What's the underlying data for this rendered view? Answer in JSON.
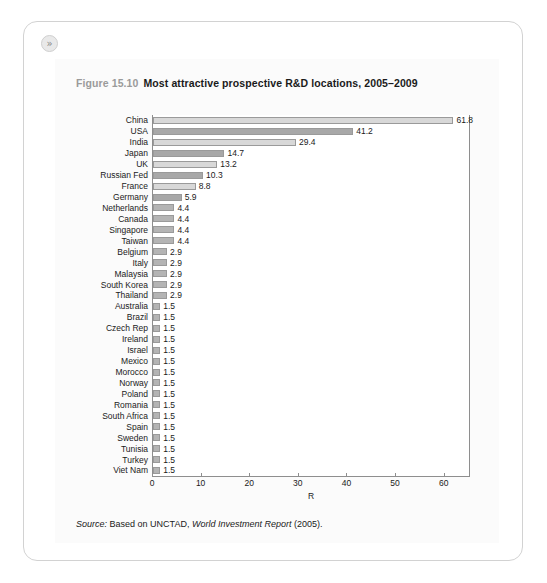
{
  "card": {
    "expand_icon": "»"
  },
  "caption": {
    "figure_number": "Figure 15.10",
    "title": "Most attractive prospective R&D locations, 2005–2009"
  },
  "source": {
    "label": "Source:",
    "text_before": " Based on UNCTAD, ",
    "publication": "World Investment Report",
    "text_after": " (2005)."
  },
  "colors": {
    "bar_light": "#d8d8d8",
    "bar_dark": "#a8a8a8",
    "bar_mid": "#b4b4b4",
    "bar_border": "#9a9a9a",
    "axis": "#8e8e8e",
    "panel_bg": "#fbfbfb",
    "card_border": "#d2d2d2",
    "figure_number_color": "#9a9a9a"
  },
  "chart_data": {
    "type": "bar",
    "orientation": "horizontal",
    "title": "Most attractive prospective R&D locations, 2005–2009",
    "xlabel": "R",
    "ylabel": "",
    "xlim": [
      0,
      65
    ],
    "xticks": [
      0,
      10,
      20,
      30,
      40,
      50,
      60
    ],
    "grid": false,
    "legend": false,
    "categories": [
      "China",
      "USA",
      "India",
      "Japan",
      "UK",
      "Russian Fed",
      "France",
      "Germany",
      "Netherlands",
      "Canada",
      "Singapore",
      "Taiwan",
      "Belgium",
      "Italy",
      "Malaysia",
      "South Korea",
      "Thailand",
      "Australia",
      "Brazil",
      "Czech Rep",
      "Ireland",
      "Israel",
      "Mexico",
      "Morocco",
      "Norway",
      "Poland",
      "Romania",
      "South Africa",
      "Spain",
      "Sweden",
      "Tunisia",
      "Turkey",
      "Viet Nam"
    ],
    "values": [
      61.8,
      41.2,
      29.4,
      14.7,
      13.2,
      10.3,
      8.8,
      5.9,
      4.4,
      4.4,
      4.4,
      4.4,
      2.9,
      2.9,
      2.9,
      2.9,
      2.9,
      1.5,
      1.5,
      1.5,
      1.5,
      1.5,
      1.5,
      1.5,
      1.5,
      1.5,
      1.5,
      1.5,
      1.5,
      1.5,
      1.5,
      1.5,
      1.5
    ],
    "value_labels": [
      "61.8",
      "41.2",
      "29.4",
      "14.7",
      "13.2",
      "10.3",
      "8.8",
      "5.9",
      "4.4",
      "4.4",
      "4.4",
      "4.4",
      "2.9",
      "2.9",
      "2.9",
      "2.9",
      "2.9",
      "1.5",
      "1.5",
      "1.5",
      "1.5",
      "1.5",
      "1.5",
      "1.5",
      "1.5",
      "1.5",
      "1.5",
      "1.5",
      "1.5",
      "1.5",
      "1.5",
      "1.5",
      "1.5"
    ],
    "bar_shades": [
      "light",
      "dark",
      "light",
      "dark",
      "light",
      "dark",
      "light",
      "dark",
      "mid",
      "mid",
      "mid",
      "mid",
      "mid",
      "mid",
      "mid",
      "mid",
      "mid",
      "mid",
      "mid",
      "mid",
      "mid",
      "mid",
      "mid",
      "mid",
      "mid",
      "mid",
      "mid",
      "mid",
      "mid",
      "mid",
      "mid",
      "mid",
      "mid"
    ]
  }
}
